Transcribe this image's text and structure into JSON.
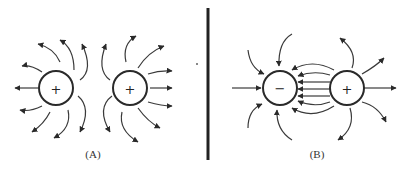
{
  "figure": {
    "panels": [
      {
        "id": "A",
        "label": "(A)",
        "description": "Field lines of two like (positive) charges",
        "charges": [
          {
            "sign": "+",
            "polarity": "positive"
          },
          {
            "sign": "+",
            "polarity": "positive"
          }
        ]
      },
      {
        "id": "B",
        "label": "(B)",
        "description": "Field lines of opposite charges (dipole)",
        "charges": [
          {
            "sign": "−",
            "polarity": "negative"
          },
          {
            "sign": "+",
            "polarity": "positive"
          }
        ]
      }
    ],
    "colors": {
      "ink": "#2a2a2a",
      "background": "#ffffff"
    }
  }
}
